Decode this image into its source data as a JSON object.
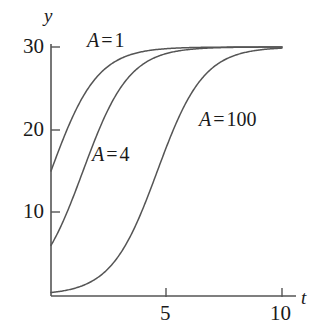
{
  "chart_data": {
    "type": "line",
    "title": "",
    "xlabel": "t",
    "ylabel": "y",
    "xlim": [
      0,
      10.6
    ],
    "ylim": [
      0,
      31.5
    ],
    "grid": false,
    "legend_position": "inline-annotations",
    "xticks": [
      5,
      10
    ],
    "xtick_labels": [
      "5",
      "10"
    ],
    "yticks": [
      10,
      20,
      30
    ],
    "ytick_labels": [
      "10",
      "20",
      "30"
    ],
    "carrying_capacity": 30,
    "growth_rate": 1.0,
    "model": "y = 30 / (1 + A e^(-t))",
    "series": [
      {
        "name": "A = 1",
        "A": 1,
        "color": "#555555",
        "label_text_var": "A",
        "label_text_eq": "=",
        "label_text_num": "1",
        "x": [
          0,
          0.25,
          0.5,
          0.75,
          1,
          1.25,
          1.5,
          1.75,
          2,
          2.25,
          2.5,
          2.75,
          3,
          3.5,
          4,
          4.5,
          5,
          5.5,
          6,
          7,
          8,
          9,
          10
        ],
        "y": [
          15.0,
          16.86,
          18.67,
          20.39,
          21.96,
          23.36,
          24.58,
          25.62,
          26.49,
          27.2,
          27.79,
          28.26,
          28.64,
          29.2,
          29.52,
          29.71,
          29.82,
          29.89,
          29.93,
          29.97,
          29.99,
          30.0,
          30.0
        ]
      },
      {
        "name": "A = 4",
        "A": 4,
        "color": "#555555",
        "label_text_var": "A",
        "label_text_eq": "=",
        "label_text_num": "4",
        "x": [
          0,
          0.25,
          0.5,
          0.75,
          1,
          1.25,
          1.5,
          1.75,
          2,
          2.25,
          2.5,
          2.75,
          3,
          3.5,
          4,
          4.5,
          5,
          5.5,
          6,
          7,
          8,
          9,
          10
        ],
        "y": [
          6.0,
          7.29,
          8.73,
          10.3,
          11.96,
          13.66,
          15.35,
          16.98,
          18.51,
          19.9,
          21.15,
          22.24,
          23.19,
          24.71,
          25.82,
          26.63,
          27.23,
          27.66,
          27.98,
          28.39,
          28.6,
          28.71,
          28.77
        ]
      },
      {
        "name": "A = 100",
        "A": 100,
        "color": "#555555",
        "label_text_var": "A",
        "label_text_eq": "=",
        "label_text_num": "100",
        "x": [
          0,
          0.5,
          1,
          1.5,
          2,
          2.5,
          3,
          3.5,
          4,
          4.5,
          5,
          5.5,
          6,
          6.5,
          7,
          7.5,
          8,
          8.5,
          9,
          9.5,
          10
        ],
        "y": [
          0.3,
          0.49,
          0.81,
          1.33,
          2.16,
          3.47,
          5.47,
          8.34,
          12.07,
          16.27,
          20.26,
          23.45,
          25.7,
          27.16,
          28.06,
          28.59,
          28.9,
          29.08,
          29.18,
          29.24,
          29.28
        ]
      }
    ],
    "annotations": [
      {
        "text": "A = 1",
        "x": 1.6,
        "y": 31.0
      },
      {
        "text": "A = 4",
        "x": 1.9,
        "y": 18.0
      },
      {
        "text": "A = 100",
        "x": 6.4,
        "y": 22.4
      }
    ]
  },
  "axes": {
    "y_axis_label": "y",
    "x_axis_label": "t",
    "ytick_30": "30",
    "ytick_20": "20",
    "ytick_10": "10",
    "xtick_5": "5",
    "xtick_10": "10"
  },
  "labels": {
    "curve1": {
      "var": "A",
      "eq": "=",
      "num": "1"
    },
    "curve2": {
      "var": "A",
      "eq": "=",
      "num": "4"
    },
    "curve3": {
      "var": "A",
      "eq": "=",
      "num": "100"
    }
  }
}
